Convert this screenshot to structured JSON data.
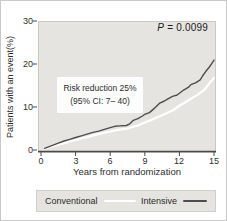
{
  "figure": {
    "p_symbol": "P",
    "p_rest": " = 0.0099",
    "annotation_line1": "Risk reduction 25%",
    "annotation_line2": "(95% CI: 7– 40)"
  },
  "chart_data": {
    "type": "line",
    "title": "",
    "xlabel": "Years from randomization",
    "ylabel": "Patients with an event(%)",
    "xlim": [
      0,
      15
    ],
    "ylim": [
      0,
      30
    ],
    "xticks": [
      0,
      3,
      6,
      9,
      12,
      15
    ],
    "yticks": [
      0,
      10,
      20,
      30
    ],
    "xtick_labels": [
      "0",
      "3",
      "6",
      "9",
      "12",
      "15"
    ],
    "ytick_labels": [
      "0",
      "10",
      "20",
      "30"
    ],
    "grid": false,
    "legend_position": "bottom",
    "annotations": [
      "P = 0.0099",
      "Risk reduction 25%",
      "(95% CI: 7– 40)"
    ],
    "axis_color": "#4a4a4a",
    "panel_color": "#e6e4e1",
    "series": [
      {
        "name": "Conventional",
        "color": "#ffffff",
        "stroke_width": 2.2,
        "points": [
          [
            0.3,
            0.3
          ],
          [
            0.8,
            0.7
          ],
          [
            1.5,
            1.2
          ],
          [
            2,
            1.6
          ],
          [
            2.5,
            2.0
          ],
          [
            3,
            2.3
          ],
          [
            3.5,
            2.7
          ],
          [
            4,
            3.0
          ],
          [
            4.5,
            3.4
          ],
          [
            5,
            3.7
          ],
          [
            5.5,
            4.0
          ],
          [
            6,
            4.3
          ],
          [
            6.5,
            4.6
          ],
          [
            7,
            4.8
          ],
          [
            7.5,
            5.0
          ],
          [
            8,
            5.4
          ],
          [
            8.5,
            5.8
          ],
          [
            9,
            6.4
          ],
          [
            9.5,
            6.9
          ],
          [
            10,
            7.5
          ],
          [
            10.5,
            8.1
          ],
          [
            11,
            8.7
          ],
          [
            11.5,
            9.3
          ],
          [
            12,
            10.3
          ],
          [
            12.5,
            11.1
          ],
          [
            13,
            11.9
          ],
          [
            13.5,
            12.7
          ],
          [
            14,
            13.7
          ],
          [
            14.3,
            14.4
          ],
          [
            14.6,
            15.5
          ],
          [
            15,
            16.8
          ]
        ]
      },
      {
        "name": "Intensive",
        "color": "#4d4d4d",
        "stroke_width": 1.4,
        "points": [
          [
            0.3,
            0.4
          ],
          [
            1,
            1.1
          ],
          [
            1.5,
            1.6
          ],
          [
            2,
            2.1
          ],
          [
            2.5,
            2.5
          ],
          [
            3,
            2.9
          ],
          [
            3.5,
            3.3
          ],
          [
            4,
            3.7
          ],
          [
            4.5,
            4.1
          ],
          [
            5,
            4.4
          ],
          [
            5.5,
            4.8
          ],
          [
            6,
            5.2
          ],
          [
            6.4,
            5.5
          ],
          [
            6.8,
            5.6
          ],
          [
            7.4,
            5.7
          ],
          [
            7.7,
            6.1
          ],
          [
            8,
            6.9
          ],
          [
            8.4,
            7.3
          ],
          [
            8.8,
            7.9
          ],
          [
            9,
            8.3
          ],
          [
            9.4,
            8.7
          ],
          [
            9.7,
            9.4
          ],
          [
            10,
            10.1
          ],
          [
            10.3,
            10.9
          ],
          [
            10.7,
            11.4
          ],
          [
            11,
            11.9
          ],
          [
            11.4,
            12.5
          ],
          [
            11.8,
            12.8
          ],
          [
            12,
            13.2
          ],
          [
            12.4,
            14.0
          ],
          [
            12.8,
            14.6
          ],
          [
            13,
            15.2
          ],
          [
            13.4,
            15.6
          ],
          [
            13.8,
            16.3
          ],
          [
            14,
            17.2
          ],
          [
            14.3,
            18.3
          ],
          [
            14.6,
            19.3
          ],
          [
            14.8,
            20.1
          ],
          [
            15,
            20.9
          ]
        ]
      }
    ]
  }
}
